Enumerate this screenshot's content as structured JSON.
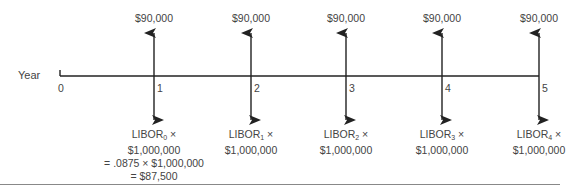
{
  "diagram": {
    "axis_label": "Year",
    "ticks": [
      "0",
      "1",
      "2",
      "3",
      "4",
      "5"
    ],
    "inflows": [
      {
        "year": "1",
        "amount": "$90,000"
      },
      {
        "year": "2",
        "amount": "$90,000"
      },
      {
        "year": "3",
        "amount": "$90,000"
      },
      {
        "year": "4",
        "amount": "$90,000"
      },
      {
        "year": "5",
        "amount": "$90,000"
      }
    ],
    "outflows": [
      {
        "year": "1",
        "rate": "LIBOR",
        "sub": "0",
        "times": " ×",
        "notional": "$1,000,000",
        "calc": "= .0875 × $1,000,000",
        "result": "= $87,500"
      },
      {
        "year": "2",
        "rate": "LIBOR",
        "sub": "1",
        "times": " ×",
        "notional": "$1,000,000"
      },
      {
        "year": "3",
        "rate": "LIBOR",
        "sub": "2",
        "times": " ×",
        "notional": "$1,000,000"
      },
      {
        "year": "4",
        "rate": "LIBOR",
        "sub": "3",
        "times": " ×",
        "notional": "$1,000,000"
      },
      {
        "year": "5",
        "rate": "LIBOR",
        "sub": "4",
        "times": " ×",
        "notional": "$1,000,000"
      }
    ],
    "colors": {
      "line": "#222222",
      "text": "#444444",
      "rule": "#888888"
    }
  }
}
